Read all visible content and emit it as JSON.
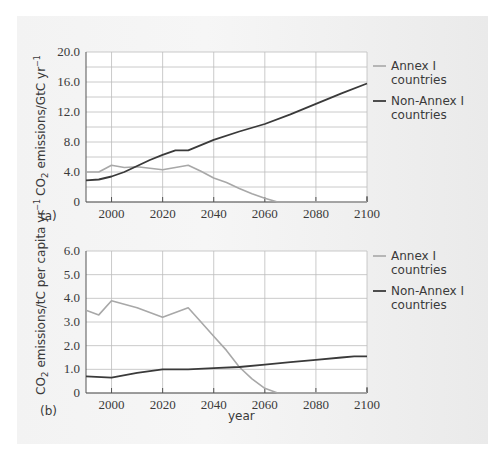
{
  "colors": {
    "annex1": "#a8a8a8",
    "non_annex1": "#3a3a3a",
    "grid": "#bdbdbd",
    "axis": "#555555",
    "panel_bg": "#f2f2f2"
  },
  "chart_data": [
    {
      "id": "a",
      "type": "line",
      "panel_label": "(a)",
      "title": "",
      "xlabel": "",
      "ylabel": "CO2 emissions/GtC yr-1",
      "ylabel_parts": {
        "pre": "CO",
        "sub": "2",
        "mid": " emissions/GtC yr",
        "sup": "−1"
      },
      "xlim": [
        1990,
        2100
      ],
      "ylim": [
        0,
        20
      ],
      "x_ticks": [
        2000,
        2020,
        2040,
        2060,
        2080,
        2100
      ],
      "x_tick_labels": [
        "2000",
        "2020",
        "2040",
        "2060",
        "2080",
        "2100"
      ],
      "y_ticks": [
        0,
        4,
        8,
        12,
        16,
        20
      ],
      "y_tick_labels": [
        "0",
        "4.0",
        "8.0",
        "12.0",
        "16.0",
        "20.0"
      ],
      "y_grid_step": 2,
      "grid": true,
      "legend_position": "right",
      "series": [
        {
          "name": "Annex I countries",
          "legend_lines": [
            "Annex I",
            "countries"
          ],
          "color": "#a8a8a8",
          "x": [
            1990,
            1995,
            2000,
            2005,
            2010,
            2015,
            2020,
            2025,
            2030,
            2035,
            2040,
            2045,
            2050,
            2055,
            2060,
            2065,
            2080,
            2100
          ],
          "values": [
            4.0,
            4.0,
            4.9,
            4.6,
            4.7,
            4.5,
            4.3,
            4.6,
            4.9,
            4.1,
            3.2,
            2.6,
            1.8,
            1.1,
            0.5,
            0.0,
            0.0,
            0.0
          ]
        },
        {
          "name": "Non-Annex I countries",
          "legend_lines": [
            "Non-Annex I",
            "countries"
          ],
          "color": "#3a3a3a",
          "x": [
            1990,
            1995,
            2000,
            2005,
            2010,
            2015,
            2020,
            2025,
            2030,
            2040,
            2050,
            2060,
            2070,
            2080,
            2090,
            2100
          ],
          "values": [
            2.9,
            3.0,
            3.4,
            4.0,
            4.8,
            5.6,
            6.3,
            6.9,
            6.9,
            8.3,
            9.4,
            10.4,
            11.7,
            13.1,
            14.5,
            15.8
          ]
        }
      ]
    },
    {
      "id": "b",
      "type": "line",
      "panel_label": "(b)",
      "title": "",
      "xlabel": "year",
      "ylabel": "CO2 emissions/tC per capita yr-1",
      "ylabel_parts": {
        "pre": "CO",
        "sub": "2",
        "mid": " emissions/tC per capita yr",
        "sup": "−1"
      },
      "xlim": [
        1990,
        2100
      ],
      "ylim": [
        0,
        6
      ],
      "x_ticks": [
        2000,
        2020,
        2040,
        2060,
        2080,
        2100
      ],
      "x_tick_labels": [
        "2000",
        "2020",
        "2040",
        "2060",
        "2080",
        "2100"
      ],
      "y_ticks": [
        0,
        1,
        2,
        3,
        4,
        5,
        6
      ],
      "y_tick_labels": [
        "0",
        "1.0",
        "2.0",
        "3.0",
        "4.0",
        "5.0",
        "6.0"
      ],
      "y_grid_step": 1,
      "grid": true,
      "legend_position": "right",
      "series": [
        {
          "name": "Annex I countries",
          "legend_lines": [
            "Annex I",
            "countries"
          ],
          "color": "#a8a8a8",
          "x": [
            1990,
            1995,
            2000,
            2010,
            2020,
            2030,
            2035,
            2040,
            2045,
            2050,
            2055,
            2060,
            2065,
            2080,
            2100
          ],
          "values": [
            3.5,
            3.3,
            3.9,
            3.6,
            3.2,
            3.6,
            3.0,
            2.4,
            1.8,
            1.1,
            0.6,
            0.2,
            0.0,
            0.0,
            0.0
          ]
        },
        {
          "name": "Non-Annex I countries",
          "legend_lines": [
            "Non-Annex I",
            "countries"
          ],
          "color": "#3a3a3a",
          "x": [
            1990,
            2000,
            2010,
            2020,
            2030,
            2040,
            2050,
            2060,
            2070,
            2080,
            2090,
            2095,
            2100
          ],
          "values": [
            0.7,
            0.65,
            0.85,
            1.0,
            1.0,
            1.05,
            1.1,
            1.2,
            1.3,
            1.4,
            1.5,
            1.55,
            1.55
          ]
        }
      ]
    }
  ]
}
